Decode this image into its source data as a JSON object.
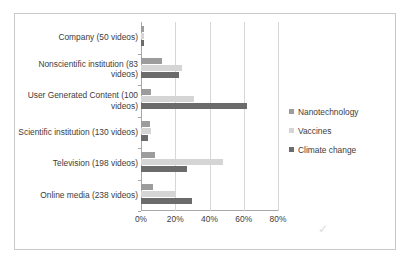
{
  "chart_data": {
    "type": "bar",
    "orientation": "horizontal",
    "title": "",
    "xlabel": "",
    "ylabel": "",
    "xlim": [
      0,
      80
    ],
    "xticks": [
      0,
      20,
      40,
      60,
      80
    ],
    "xtick_labels": [
      "0%",
      "20%",
      "40%",
      "60%",
      "80%"
    ],
    "grid": true,
    "legend_position": "right",
    "categories": [
      "Company (50 videos)",
      "Nonscientific institution (83 videos)",
      "User Generated Content (100 videos)",
      "Scientific institution (130 videos)",
      "Television (198 videos)",
      "Online media (238 videos)"
    ],
    "series": [
      {
        "name": "Nanotechnology",
        "color": "#9c9c9c",
        "values": [
          2,
          12,
          6,
          5,
          8,
          7
        ]
      },
      {
        "name": "Vaccines",
        "color": "#d5d5d5",
        "values": [
          2,
          24,
          31,
          6,
          48,
          20
        ]
      },
      {
        "name": "Climate change",
        "color": "#6b6b6b",
        "values": [
          2,
          22,
          62,
          4,
          27,
          30
        ]
      }
    ]
  },
  "legend": {
    "items": [
      {
        "label": "Nanotechnology",
        "color": "#9c9c9c"
      },
      {
        "label": "Vaccines",
        "color": "#d5d5d5"
      },
      {
        "label": "Climate change",
        "color": "#6b6b6b"
      }
    ]
  },
  "artifact": {
    "mark": "✓"
  }
}
